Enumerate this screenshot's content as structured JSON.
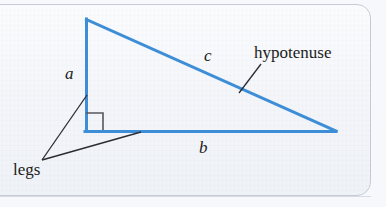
{
  "figure": {
    "type": "geometry-diagram",
    "background_color": "#f4f6fa",
    "frame_color": "#c9cdd8",
    "triangle_color": "#3d8ed6",
    "leader_line_color": "#2b2b33",
    "right_angle_marker_color": "#55555f"
  },
  "labels": {
    "leg_a": "a",
    "leg_b": "b",
    "hypotenuse_letter": "c",
    "hypotenuse_word": "hypotenuse",
    "legs_word": "legs"
  },
  "geometry": {
    "vertices": {
      "top": [
        86,
        19
      ],
      "right_angle": [
        86,
        131
      ],
      "right": [
        336,
        131
      ]
    },
    "right_angle_marker": {
      "x": 86,
      "y": 113,
      "size": 17
    },
    "leader_lines": [
      {
        "name": "hypotenuse-leader",
        "from": [
          261,
          64
        ],
        "to": [
          239,
          93
        ]
      },
      {
        "name": "legs-leader-to-a",
        "from": [
          42,
          160
        ],
        "to": [
          87,
          95
        ]
      },
      {
        "name": "legs-leader-to-b",
        "from": [
          42,
          160
        ],
        "to": [
          141,
          132
        ]
      }
    ]
  }
}
